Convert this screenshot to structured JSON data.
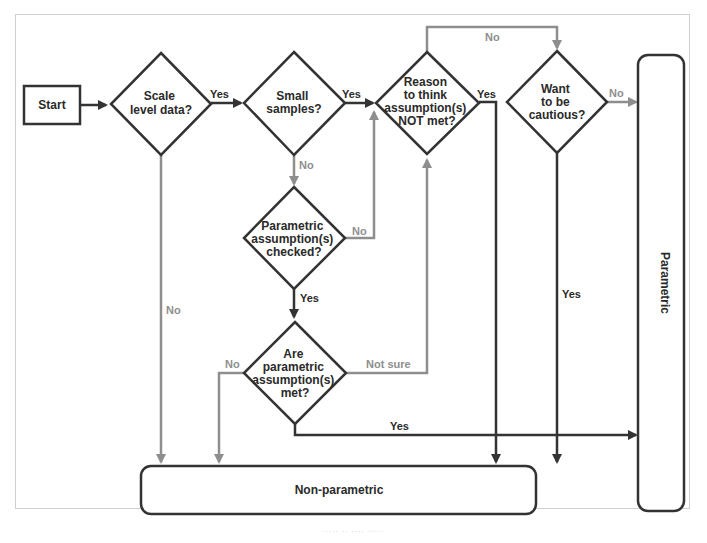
{
  "colors": {
    "dark": "#333333",
    "gray": "#8e8e8e",
    "frame": "#cfcfcf",
    "background": "#ffffff"
  },
  "nodes": {
    "start": {
      "label": "Start",
      "shape": "rectangle"
    },
    "scale_level": {
      "lines": [
        "Scale",
        "level data?"
      ],
      "shape": "diamond"
    },
    "small_samples": {
      "lines": [
        "Small",
        "samples?"
      ],
      "shape": "diamond"
    },
    "reason_not_met": {
      "lines": [
        "Reason",
        "to think",
        "assumption(s)",
        "NOT met?"
      ],
      "shape": "diamond"
    },
    "want_cautious": {
      "lines": [
        "Want",
        "to be",
        "cautious?"
      ],
      "shape": "diamond"
    },
    "assumptions_checked": {
      "lines": [
        "Parametric",
        "assumption(s)",
        "checked?"
      ],
      "shape": "diamond"
    },
    "assumptions_met": {
      "lines": [
        "Are",
        "parametric",
        "assumption(s)",
        "met?"
      ],
      "shape": "diamond"
    },
    "parametric": {
      "label": "Parametric",
      "shape": "rounded-rectangle-vertical"
    },
    "non_parametric": {
      "label": "Non-parametric",
      "shape": "rounded-rectangle"
    }
  },
  "edges": [
    {
      "from": "start",
      "to": "scale_level",
      "label": "",
      "style": "dark"
    },
    {
      "from": "scale_level",
      "to": "small_samples",
      "label": "Yes",
      "style": "dark"
    },
    {
      "from": "scale_level",
      "to": "non_parametric",
      "label": "No",
      "style": "gray"
    },
    {
      "from": "small_samples",
      "to": "reason_not_met",
      "label": "Yes",
      "style": "dark"
    },
    {
      "from": "small_samples",
      "to": "assumptions_checked",
      "label": "No",
      "style": "gray"
    },
    {
      "from": "assumptions_checked",
      "to": "reason_not_met",
      "label": "No",
      "style": "gray"
    },
    {
      "from": "assumptions_checked",
      "to": "assumptions_met",
      "label": "Yes",
      "style": "dark"
    },
    {
      "from": "assumptions_met",
      "to": "non_parametric",
      "label": "No",
      "style": "gray"
    },
    {
      "from": "assumptions_met",
      "to": "reason_not_met",
      "label": "Not sure",
      "style": "gray"
    },
    {
      "from": "assumptions_met",
      "to": "parametric",
      "label": "Yes",
      "style": "dark"
    },
    {
      "from": "reason_not_met",
      "to": "want_cautious",
      "label": "No",
      "style": "gray"
    },
    {
      "from": "reason_not_met",
      "to": "non_parametric",
      "label": "Yes",
      "style": "dark"
    },
    {
      "from": "want_cautious",
      "to": "parametric",
      "label": "No",
      "style": "gray"
    },
    {
      "from": "want_cautious",
      "to": "non_parametric",
      "label": "Yes",
      "style": "dark"
    }
  ],
  "edge_labels": {
    "scale_yes": "Yes",
    "scale_no": "No",
    "small_yes": "Yes",
    "small_no": "No",
    "checked_no": "No",
    "checked_yes": "Yes",
    "met_no": "No",
    "met_notsure": "Not sure",
    "met_yes": "Yes",
    "reason_no": "No",
    "reason_yes": "Yes",
    "cautious_no": "No",
    "cautious_yes": "Yes"
  },
  "caption": "····· ·· ···· ·····"
}
